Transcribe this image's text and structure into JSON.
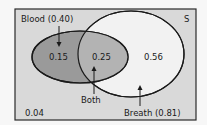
{
  "diagram": {
    "type": "venn",
    "universe_label": "S",
    "sets": [
      {
        "name": "Blood",
        "label": "Blood (0.40)",
        "probability": 0.4,
        "fill": "#9a9a9a"
      },
      {
        "name": "Breath",
        "label": "Breath (0.81)",
        "probability": 0.81,
        "fill": "#f2f2f2"
      }
    ],
    "regions": {
      "blood_only": "0.15",
      "both": "0.25",
      "breath_only": "0.56",
      "neither": "0.04"
    },
    "intersection_label": "Both",
    "colors": {
      "background": "#d9d9d9",
      "border": "#2a2a2a",
      "blood_fill": "#9a9a9a",
      "both_fill": "#b3b3b3",
      "breath_fill": "#f2f2f2"
    }
  }
}
